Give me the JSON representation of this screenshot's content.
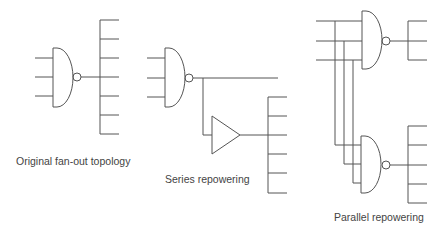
{
  "diagram": {
    "panels": [
      {
        "id": "original",
        "label": "Original fan-out topology",
        "gates": [
          "NAND"
        ],
        "fanout_count": 7
      },
      {
        "id": "series",
        "label": "Series repowering",
        "gates": [
          "NAND",
          "buffer"
        ],
        "fanout_count": 6
      },
      {
        "id": "parallel",
        "label": "Parallel repowering",
        "gates": [
          "NAND",
          "NAND"
        ],
        "fanout_counts": [
          3,
          5
        ]
      }
    ],
    "colors": {
      "line": "#555555",
      "text": "#444444",
      "background": "#ffffff"
    }
  }
}
